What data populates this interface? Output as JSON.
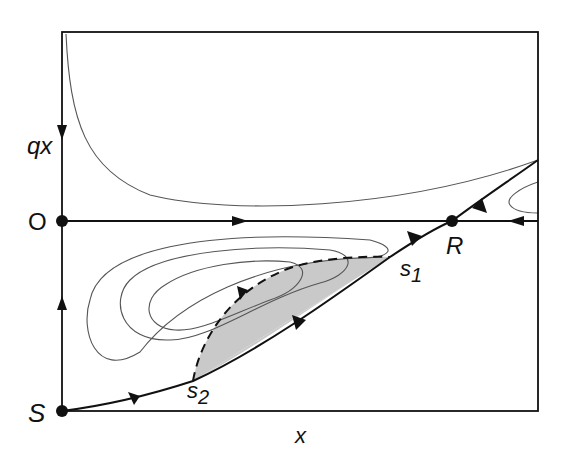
{
  "figure": {
    "type": "phase-portrait",
    "axes": {
      "x_label": "x",
      "y_label": "q",
      "y_label_sub": "x"
    },
    "fixed_points": [
      {
        "id": "O",
        "label": "O"
      },
      {
        "id": "R",
        "label": "R"
      },
      {
        "id": "S",
        "label": "S"
      }
    ],
    "section_points": [
      {
        "id": "s1",
        "label": "s",
        "sub": "1"
      },
      {
        "id": "s2",
        "label": "s",
        "sub": "2"
      }
    ],
    "colors": {
      "line": "#111111",
      "thin_line": "#555555",
      "shaded_region": "#c9c9c9"
    }
  }
}
